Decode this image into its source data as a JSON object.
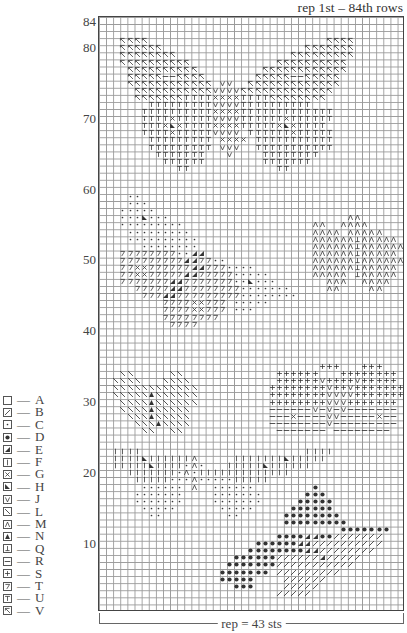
{
  "title": "rep 1st – 84th rows",
  "repeat_label": "rep = 43 sts",
  "chart": {
    "columns": 43,
    "rows": 84,
    "row_labels": [
      {
        "row": 84,
        "label": "84"
      },
      {
        "row": 80,
        "label": "80"
      },
      {
        "row": 70,
        "label": "70"
      },
      {
        "row": 60,
        "label": "60"
      },
      {
        "row": 50,
        "label": "50"
      },
      {
        "row": 40,
        "label": "40"
      },
      {
        "row": 30,
        "label": "30"
      },
      {
        "row": 20,
        "label": "20"
      },
      {
        "row": 10,
        "label": "10"
      }
    ],
    "grid_color": "#999999",
    "border_color": "#444444",
    "symbol_color": "#333333"
  },
  "legend": [
    {
      "symbol": "A",
      "icon": "empty-square-icon",
      "label": "A"
    },
    {
      "symbol": "B",
      "icon": "slash-square-icon",
      "label": "B"
    },
    {
      "symbol": "C",
      "icon": "small-dot-square-icon",
      "label": "C"
    },
    {
      "symbol": "D",
      "icon": "large-dot-square-icon",
      "label": "D"
    },
    {
      "symbol": "E",
      "icon": "lower-right-triangle-square-icon",
      "label": "E"
    },
    {
      "symbol": "F",
      "icon": "vertical-bar-square-icon",
      "label": "F"
    },
    {
      "symbol": "G",
      "icon": "x-square-icon",
      "label": "G"
    },
    {
      "symbol": "H",
      "icon": "lower-left-triangle-square-icon",
      "label": "H"
    },
    {
      "symbol": "J",
      "icon": "v-square-icon",
      "label": "J"
    },
    {
      "symbol": "L",
      "icon": "backslash-square-icon",
      "label": "L"
    },
    {
      "symbol": "M",
      "icon": "caret-square-icon",
      "label": "M"
    },
    {
      "symbol": "N",
      "icon": "filled-triangle-square-icon",
      "label": "N"
    },
    {
      "symbol": "Q",
      "icon": "inverted-t-square-icon",
      "label": "Q"
    },
    {
      "symbol": "R",
      "icon": "horizontal-bar-square-icon",
      "label": "R"
    },
    {
      "symbol": "S",
      "icon": "plus-square-icon",
      "label": "S"
    },
    {
      "symbol": "T",
      "icon": "seven-square-icon",
      "label": "T"
    },
    {
      "symbol": "U",
      "icon": "t-square-icon",
      "label": "U"
    },
    {
      "symbol": "V",
      "icon": "flag-square-icon",
      "label": "V"
    }
  ],
  "pattern_rows_note": "Each string = one chart row, index 0 is row 84 (top). Characters map to legend symbols; '.' = A (empty).",
  "pattern": [
    "...........................................",
    "...........................................",
    "...........................................",
    "...VVVV.........................VVVV.......",
    "...VVVVVV....................VVVVVVV.......",
    "...VVVVVVVV................VVVVVVVVV.......",
    "...VVVVVVVVVV............VVVVVVVVVV........",
    "....VVVVVVVVVV.........VVVVVVVVVVVV........",
    "....VVVVVRRVVVV.......VVVVVRRVVVVV.........",
    "....VVVVVVVVVVVV.JJ..VVVVVVVVVVVVV.........",
    ".....VVVVVVVVVVVJJJJVVVVVVVVVVVVV..........",
    ".....VVVVVVVUUUUGGGGUUUUVVVVVVVV...........",
    ".......UUUUUUUUUJJJJUUUUUUUUUU.............",
    "......UUUUUUUUUUGGGGUUUUUUUUUUUUU..........",
    "......UUUUGUUUUUJJJJUUUUUUGUUUUUU..........",
    "......UUUGHGUUUUGGGGUUUUUGHGUUUU...........",
    "......UUUUGUUUUUJJJJ.UUUUUUGUUUUU..........",
    ".......UUUUUUUUU.GGGG.UUUUUUUUUUU..........",
    ".......UUUUUUUUU.JJJ..UUUUUUUUUUU..........",
    "........UUUUUUU...J....UUUUUUUU............",
    ".........UUUUUU........UUUUUUU.............",
    "...........UU............UU................",
    "...........................................",
    "...........................................",
    "...........................................",
    "....CC.....................................",
    "....CCC....................................",
    "...CCCCC...................................",
    "...CCCHCCC.........................MM......",
    "...CCCCCCCCC..................MM..MMMM.....",
    "....CCCCCCCCC.................MMMM.MMMMM...",
    "....CCCCCCCCCC................MMMMMMQMMMMM.",
    "......CCCCCCCC................MMMMMMQMMMMMM",
    "...TTTTTTTTCCEE...............MMMMMMQMMMMM.",
    "...TTTTTTTTTEETTCC............MMMMMMQMMMMMM",
    "...TTGGTTTTTTEETTTCCCC........MMMMMMQMMMMM.",
    "...TTGGTTTTTEETTTTTCCCCC......MMMMM.QMMMMM.",
    "...TTTTTTTEETTTTTTTCCHCCC.......MMM..MMMM..",
    ".....TTTTTEETTTTTTTTCCCCCCC.....MM....MM...",
    "......TTTEETTTTTTTTTCCCCCCCC...............",
    ".........TTTTGGTTT.CCCCC...................",
    ".........TTTTGGTTT.CCC.....................",
    ".........TTTTTTTT..........................",
    "..........TTTT.............................",
    "...........................................",
    "...........................................",
    "...........................................",
    "...........................................",
    "...........................................",
    "...............................SSS...SSS...",
    "...LL.....LL.............SSSSSS...SSSSSSSS.",
    "..LLLL...LLLL............SSSSSSJSSSSJSSSSS.",
    "..LLLLLLLLLLLL..........SSSSSSSSJSSJSSSSSSS",
    "..LLLLLNLLLLLL..........SSSSSSSSJJJJSSSSSSS",
    "...LLLLNLLLLLL..........SSSSSSSSJJJSSSSSSS.",
    "...LLLLNLLLLL...........RRRRRRJRJRJRRRRRRR.",
    "....LLLNLLLLL...........RRRGRRRRJJRRRRRGRR.",
    ".....LLLNLLLL...........RRRRRRRRJRRRRRRRRR.",
    "......LL..LL.............RRRRRRR.RRRRRRRR..",
    "...........................................",
    "...........................................",
    "..FFFF.......................FFFF..........",
    "..FFFFHFFFFFFM.....FFFFFFFHFFFFF...........",
    "..FFFFFHFFFFCMC...FFFFFHFFFFFF.............",
    "....FFFFFFFCMCFFFFFFFFFFFFF................",
    ".....FFFFFCCCMCCCCCFFFFF...................",
    "......CCCCCC.M..CCCCCC........D............",
    ".....CCCCCCC....CCCCCCC......DDD...........",
    ".....CCCCCCC....CCCCCCC.....DDDDD..........",
    "......CCCCC......CCCCC.....DDDDDD..........",
    ".......CC.........CC......DDDDDDDD.........",
    "..........................DDDDDDDDD........",
    "..................................DDDDDDD..",
    ".........................DDDDEEDDBBBBBBB...",
    "......................DDDDDDEEBBBBBBBBBB...",
    ".....................DDDDDDDDEEBBBBBBBB....",
    "...................DDDDDDBBBBBBEBBBBB......",
    "..................DDDDDDDBBBBBBBBBBB.......",
    ".................DDDDDDD.BBBBBBBBB.........",
    ".................DDDDD....BBBBBB...........",
    "...................DDD....BBBBB............",
    ".........................BBBBB.............",
    "...........................................",
    "..........................................."
  ]
}
